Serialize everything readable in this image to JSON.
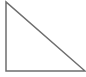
{
  "diagram": {
    "shape": "right-triangle",
    "stroke_color": "#6e6e6e",
    "fill_color": "#ffffff",
    "stroke_width": 1.5,
    "vertices": {
      "top": [
        6,
        2
      ],
      "bottom_left": [
        6,
        71
      ],
      "bottom_right": [
        85,
        71
      ]
    }
  }
}
